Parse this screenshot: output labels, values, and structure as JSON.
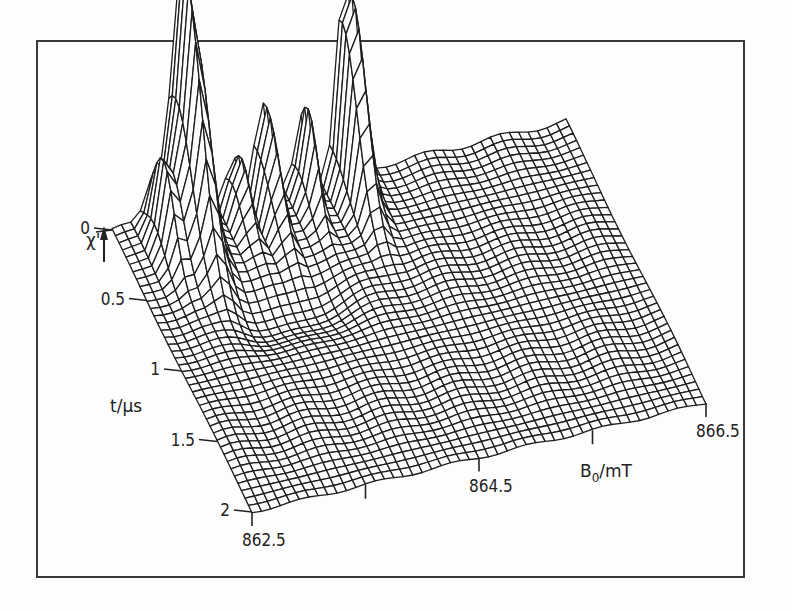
{
  "figure": {
    "frame_color": "#3a3a3a",
    "line_color": "#1e1e1e",
    "background": "#fdfdfd"
  },
  "chart_data": {
    "type": "surface-3d-wireframe",
    "title": "",
    "zlabel": "χ''",
    "ylabel": "t/µs",
    "xlabel": "B0/mT",
    "xlabel_main": "B",
    "xlabel_sub": "0",
    "xlabel_unit": "/mT",
    "x_axis": {
      "name": "B0",
      "unit": "mT",
      "range": [
        862.5,
        866.5
      ],
      "tick_values": [
        862.5,
        863.5,
        864.5,
        865.5,
        866.5
      ],
      "tick_labels": [
        "862.5",
        "",
        "864.5",
        "",
        "866.5"
      ]
    },
    "y_axis": {
      "name": "t",
      "unit": "µs",
      "range": [
        0,
        2
      ],
      "tick_values": [
        0,
        0.5,
        1,
        1.5,
        2
      ],
      "tick_labels": [
        "0",
        "0.5",
        "1",
        "1.5",
        "2"
      ]
    },
    "z_axis": {
      "name": "χ''",
      "arrow": "up",
      "units": "arbitrary"
    },
    "grid": {
      "x_lines": 48,
      "y_lines": 40
    },
    "features": [
      {
        "label": "main double-topped peak",
        "B0_mT": 863.1,
        "t_us": 0.1,
        "relative_height": 1.0,
        "width_B": 0.12,
        "width_t": 0.33
      },
      {
        "label": "left shoulder peak",
        "B0_mT": 862.85,
        "t_us": 0.2,
        "relative_height": 0.35,
        "width_B": 0.09,
        "width_t": 0.22
      },
      {
        "label": "thin central spike",
        "B0_mT": 863.8,
        "t_us": 0.05,
        "relative_height": 0.55,
        "width_B": 0.05,
        "width_t": 0.28
      },
      {
        "label": "small side spike",
        "B0_mT": 863.55,
        "t_us": 0.1,
        "relative_height": 0.35,
        "width_B": 0.05,
        "width_t": 0.2
      },
      {
        "label": "small spike",
        "B0_mT": 864.15,
        "t_us": 0.1,
        "relative_height": 0.38,
        "width_B": 0.06,
        "width_t": 0.2
      },
      {
        "label": "right tall peak",
        "B0_mT": 864.55,
        "t_us": 0.05,
        "relative_height": 0.78,
        "width_B": 0.1,
        "width_t": 0.3
      },
      {
        "label": "shallow trough ridge",
        "B0_mT": 863.6,
        "t_us": 0.75,
        "relative_height": -0.08,
        "width_B": 0.5,
        "width_t": 0.22
      }
    ],
    "projection": {
      "origin_front_left": [
        252,
        512
      ],
      "x_vector": [
        454,
        -109
      ],
      "y_vector_back": [
        -140,
        -282
      ],
      "z_scale": 520
    }
  }
}
